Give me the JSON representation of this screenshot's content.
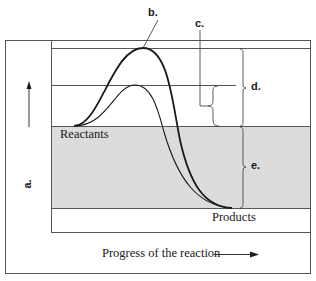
{
  "diagram": {
    "labels": {
      "a": "a.",
      "b": "b.",
      "c": "c.",
      "d": "d.",
      "e": "e."
    },
    "regions": {
      "reactants": "Reactants",
      "products": "Products"
    },
    "axes": {
      "x_label": "Progress of the reaction",
      "y_label_placeholder": "a."
    },
    "curves": [
      {
        "name": "uncatalyzed",
        "style": "thick",
        "peak_level": "high"
      },
      {
        "name": "catalyzed",
        "style": "thin",
        "peak_level": "low"
      }
    ],
    "colors": {
      "line": "#1a1a1a",
      "frame": "#555555",
      "shaded_region": "#dcdcdc",
      "background": "#ffffff"
    }
  }
}
